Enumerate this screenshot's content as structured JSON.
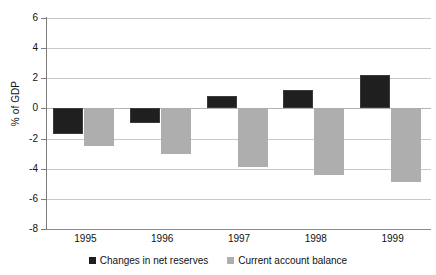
{
  "chart_data": {
    "type": "bar",
    "title": "",
    "subtitle": "",
    "xlabel": "",
    "ylabel": "% of GDP",
    "categories": [
      "1995",
      "1996",
      "1997",
      "1998",
      "1999"
    ],
    "series": [
      {
        "name": "Changes in net reserves",
        "color": "#1f1f1f",
        "values": [
          -1.7,
          -1.0,
          0.8,
          1.2,
          2.2
        ]
      },
      {
        "name": "Current account balance",
        "color": "#aeaeae",
        "values": [
          -2.5,
          -3.0,
          -3.9,
          -4.4,
          -4.9
        ]
      }
    ],
    "ylim": [
      -8,
      6
    ],
    "ytick_values": [
      6,
      4,
      2,
      0,
      -2,
      -4,
      -6,
      -8
    ],
    "ytick_labels": [
      "6",
      "4",
      "2",
      "0",
      "-2",
      "-4",
      "-6",
      "-8"
    ],
    "grid": true,
    "grid_axis": "y",
    "legend_position": "bottom-center",
    "bar_layout": "grouped"
  },
  "legend": {
    "entries": [
      {
        "label": "Changes in net reserves",
        "swatch": "dark"
      },
      {
        "label": "Current account balance",
        "swatch": "light"
      }
    ]
  }
}
